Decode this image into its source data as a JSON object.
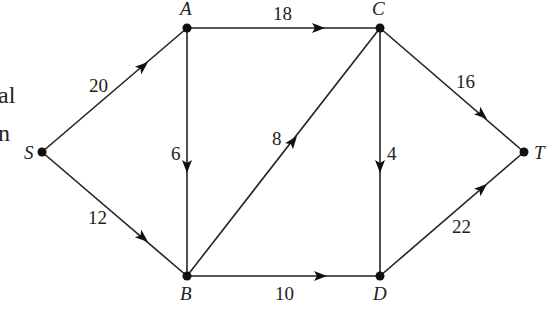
{
  "left_text_fragments": [
    "al",
    "n"
  ],
  "nodes": [
    {
      "id": "S",
      "label": "S",
      "x": 42,
      "y": 152
    },
    {
      "id": "A",
      "label": "A",
      "x": 187,
      "y": 28
    },
    {
      "id": "C",
      "label": "C",
      "x": 380,
      "y": 28
    },
    {
      "id": "T",
      "label": "T",
      "x": 524,
      "y": 152
    },
    {
      "id": "B",
      "label": "B",
      "x": 187,
      "y": 276
    },
    {
      "id": "D",
      "label": "D",
      "x": 380,
      "y": 276
    }
  ],
  "edges": [
    {
      "from": "S",
      "to": "A",
      "capacity": "20"
    },
    {
      "from": "S",
      "to": "B",
      "capacity": "12"
    },
    {
      "from": "A",
      "to": "C",
      "capacity": "18"
    },
    {
      "from": "A",
      "to": "B",
      "capacity": "6"
    },
    {
      "from": "B",
      "to": "C",
      "capacity": "8"
    },
    {
      "from": "B",
      "to": "D",
      "capacity": "10"
    },
    {
      "from": "C",
      "to": "D",
      "capacity": "4"
    },
    {
      "from": "C",
      "to": "T",
      "capacity": "16"
    },
    {
      "from": "D",
      "to": "T",
      "capacity": "22"
    }
  ]
}
